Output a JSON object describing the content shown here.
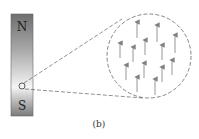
{
  "figure": {
    "caption": "(b)",
    "magnet": {
      "north_label": "N",
      "south_label": "S",
      "gradient_top": "#6e6e6e",
      "gradient_mid": "#f2f2f2",
      "gradient_bottom": "#7a7a7a"
    },
    "magnified_view": {
      "description": "Magnified region of the magnet showing aligned magnetic domains (arrows pointing toward N)",
      "arrow_count": 13,
      "arrow_color": "#888888",
      "outline_color": "#555555"
    }
  }
}
